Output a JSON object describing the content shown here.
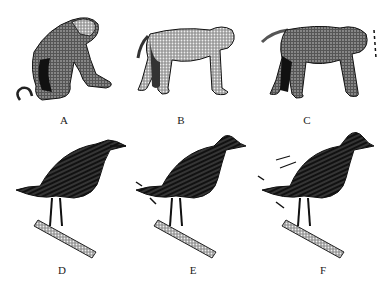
{
  "figure": {
    "panels": [
      {
        "id": "A",
        "label": "A",
        "subject": "monkey-sitting-crouched"
      },
      {
        "id": "B",
        "label": "B",
        "subject": "monkey-standing-calm"
      },
      {
        "id": "C",
        "label": "C",
        "subject": "monkey-standing-aggressive-with-motion-lines"
      },
      {
        "id": "D",
        "label": "D",
        "subject": "bird-perched-calm"
      },
      {
        "id": "E",
        "label": "E",
        "subject": "bird-perched-slightly-ruffled-with-arrows"
      },
      {
        "id": "F",
        "label": "F",
        "subject": "bird-perched-fully-ruffled-with-arrows"
      }
    ]
  }
}
